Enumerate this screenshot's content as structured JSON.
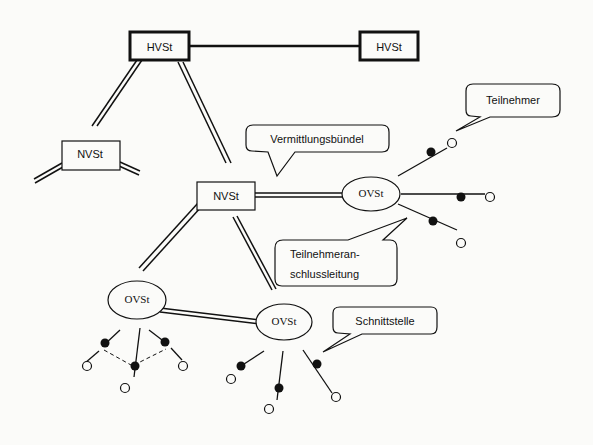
{
  "diagram": {
    "nodes": {
      "hvst_left": {
        "label": "HVSt"
      },
      "hvst_right": {
        "label": "HVSt"
      },
      "nvst_left": {
        "label": "NVSt"
      },
      "nvst_center": {
        "label": "NVSt"
      },
      "ovst_right": {
        "label": "OVSt"
      },
      "ovst_bottom_left": {
        "label": "OVSt"
      },
      "ovst_bottom_center": {
        "label": "OVSt"
      }
    },
    "callouts": {
      "teilnehmer": {
        "label": "Teilnehmer"
      },
      "vermittlungsbuendel": {
        "label": "Vermittlungsbündel"
      },
      "teilnehmeranschlussleitung": {
        "line1": "Teilnehmeran-",
        "line2": "schlussleitung"
      },
      "schnittstelle": {
        "label": "Schnittstelle"
      }
    },
    "colors": {
      "background": "#fbfbf9",
      "stroke": "#111111"
    }
  }
}
